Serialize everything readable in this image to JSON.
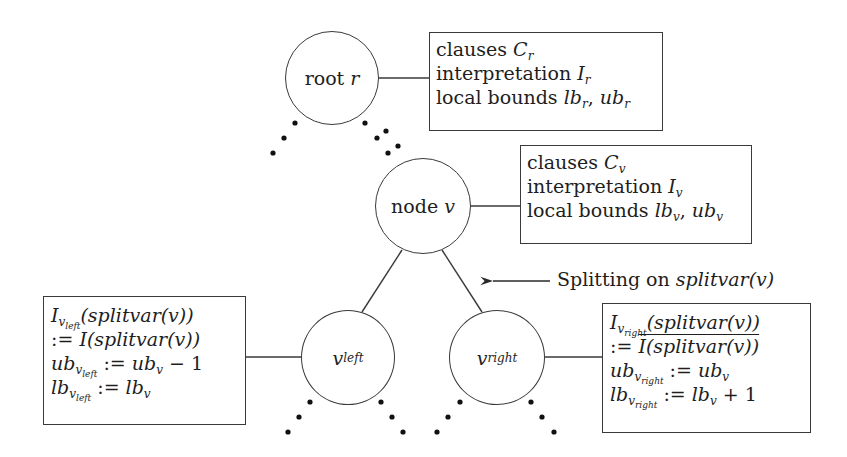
{
  "diagram": {
    "nodes": {
      "root": {
        "text": "root ",
        "var": "r"
      },
      "v": {
        "text": "node ",
        "var": "v"
      },
      "v_left": {
        "var": "v",
        "sub": "left"
      },
      "v_right": {
        "var": "v",
        "sub": "right"
      }
    },
    "root_box": {
      "lines": [
        {
          "prefix": "clauses ",
          "sym": "C",
          "sub": "r"
        },
        {
          "prefix": "interpretation ",
          "sym": "I",
          "sub": "r"
        },
        {
          "prefix": "local bounds ",
          "sym1": "lb",
          "sub1": "r",
          "sep": ", ",
          "sym2": "ub",
          "sub2": "r"
        }
      ]
    },
    "v_box": {
      "lines": [
        {
          "prefix": "clauses ",
          "sym": "C",
          "sub": "v"
        },
        {
          "prefix": "interpretation ",
          "sym": "I",
          "sub": "v"
        },
        {
          "prefix": "local bounds ",
          "sym1": "lb",
          "sub1": "v",
          "sep": ", ",
          "sym2": "ub",
          "sub2": "v"
        }
      ]
    },
    "left_box": {
      "line1": {
        "sym": "I",
        "sub": "v",
        "subsub": "left",
        "rest": "(splitvar(v))"
      },
      "line2": {
        "op": ":= ",
        "rest": "I(splitvar(v))"
      },
      "line3": {
        "sym": "ub",
        "sub": "v",
        "subsub": "left",
        "op": " := ",
        "rhs": "ub",
        "rhs_sub": "v",
        "tail": " − 1"
      },
      "line4": {
        "sym": "lb",
        "sub": "v",
        "subsub": "left",
        "op": " := ",
        "rhs": "lb",
        "rhs_sub": "v",
        "tail": ""
      }
    },
    "right_box": {
      "line1": {
        "sym": "I",
        "sub": "v",
        "subsub": "right",
        "rest": "(splitvar(v))"
      },
      "line2": {
        "op": ":= ",
        "rest": "I(splitvar(v))",
        "overlined": true
      },
      "line3": {
        "sym": "ub",
        "sub": "v",
        "subsub": "right",
        "op": " := ",
        "rhs": "ub",
        "rhs_sub": "v",
        "tail": ""
      },
      "line4": {
        "sym": "lb",
        "sub": "v",
        "subsub": "right",
        "op": " := ",
        "rhs": "lb",
        "rhs_sub": "v",
        "tail": " + 1"
      }
    },
    "split_label": {
      "text": "Splitting on ",
      "fn": "splitvar",
      "arg": "(v)"
    }
  }
}
